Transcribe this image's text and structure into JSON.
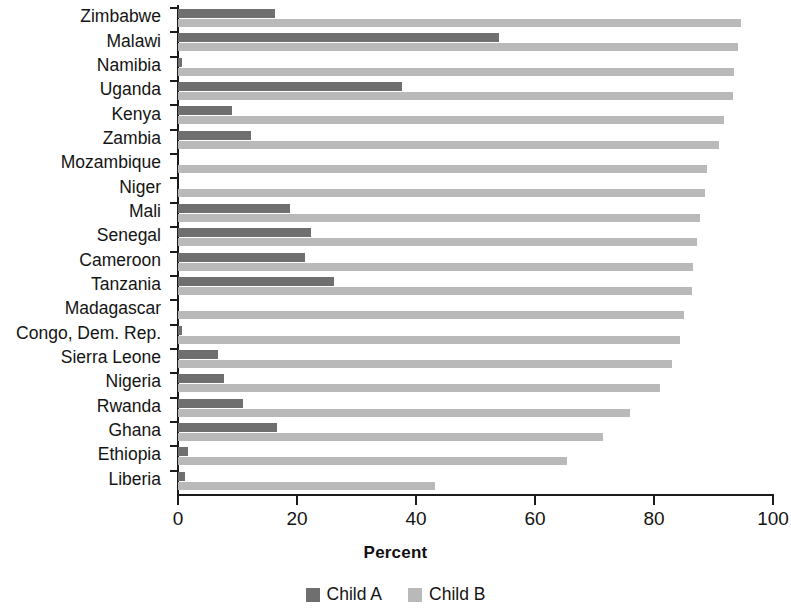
{
  "chart_data": {
    "type": "bar",
    "orientation": "horizontal",
    "title": "",
    "xlabel": "Percent",
    "ylabel": "",
    "xlim": [
      0,
      100
    ],
    "xticks": [
      0,
      20,
      40,
      60,
      80,
      100
    ],
    "grid": false,
    "legend_position": "bottom",
    "categories": [
      "Zimbabwe",
      "Malawi",
      "Namibia",
      "Uganda",
      "Kenya",
      "Zambia",
      "Mozambique",
      "Niger",
      "Mali",
      "Senegal",
      "Cameroon",
      "Tanzania",
      "Madagascar",
      "Congo, Dem. Rep.",
      "Sierra Leone",
      "Nigeria",
      "Rwanda",
      "Ghana",
      "Ethiopia",
      "Liberia"
    ],
    "series": [
      {
        "name": "Child A",
        "color": "#6f6f6f",
        "values": [
          16.3,
          54.0,
          0.7,
          37.7,
          9.1,
          12.3,
          0.0,
          0.0,
          18.8,
          22.4,
          21.3,
          26.2,
          0.0,
          0.7,
          6.7,
          7.7,
          10.9,
          16.6,
          1.7,
          1.2
        ]
      },
      {
        "name": "Child B",
        "color": "#b9b9b9",
        "values": [
          94.6,
          94.2,
          93.5,
          93.2,
          91.8,
          91.0,
          88.9,
          88.6,
          87.7,
          87.2,
          86.6,
          86.4,
          85.0,
          84.4,
          83.0,
          81.0,
          76.0,
          71.5,
          65.3,
          43.2
        ]
      }
    ]
  },
  "legend": {
    "items": [
      {
        "label": "Child A",
        "color": "#6f6f6f"
      },
      {
        "label": "Child B",
        "color": "#b9b9b9"
      }
    ]
  }
}
